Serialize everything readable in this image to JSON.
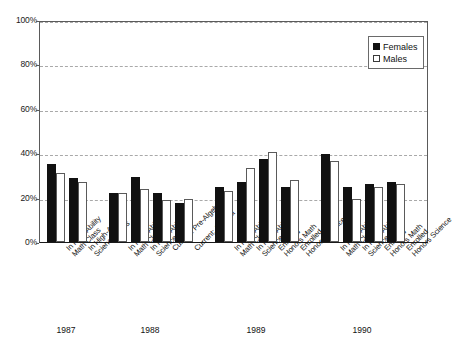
{
  "chart_data": {
    "type": "bar",
    "title": "",
    "xlabel": "",
    "ylabel": "",
    "ylim": [
      0,
      100
    ],
    "ytick_labels": [
      "100%",
      "80%",
      "60%",
      "40%",
      "20%",
      "0%"
    ],
    "yticks": [
      100,
      80,
      60,
      40,
      20,
      0
    ],
    "grid": "horizontal dashed gridlines at 20% intervals",
    "legend_position": "top-right inside plot",
    "value_unit": "percent",
    "legend": [
      {
        "name": "Females",
        "color": "#111111",
        "swatch": "filled-square"
      },
      {
        "name": "Males",
        "color": "#ffffff",
        "swatch": "open-square"
      }
    ],
    "series": [
      {
        "name": "Females",
        "values": [
          35,
          29,
          22,
          29.5,
          22,
          17.5,
          25,
          27,
          37.5,
          25,
          39.5,
          25,
          26,
          27
        ]
      },
      {
        "name": "Males",
        "values": [
          31,
          27,
          22,
          24,
          19,
          19.5,
          23,
          33.5,
          40.5,
          28,
          36.5,
          19.5,
          25,
          26
        ]
      }
    ],
    "categories": [
      "In High-Ability Math Class",
      "In High-Ability Science Class",
      "In High-Ability Math Class",
      "In High-Ability Science Class",
      "Current: Pre-Algebra",
      "Current: Algebra",
      "In High-Ability Math Class",
      "In High-Ability Science Class",
      "Enrolled Honors Math",
      "Enrolled Honors Science",
      "In High-Ability Math Class",
      "In High-Ability Science Class",
      "Enrolled Honors Math",
      "Enrolled Honors Science"
    ],
    "category_lines": [
      [
        "In High-Ability",
        "Math Class"
      ],
      [
        "In High-Ability",
        "Science Class"
      ],
      [
        "In High-Ability",
        "Math Class"
      ],
      [
        "In High-Ability",
        "Science Class"
      ],
      [
        "Current: Pre-Algebra",
        ""
      ],
      [
        "Current: Algebra",
        ""
      ],
      [
        "In High-Ability",
        "Math Class"
      ],
      [
        "In High-Ability",
        "Science Class"
      ],
      [
        "Enrolled",
        "Honors Math"
      ],
      [
        "Enrolled",
        "Honors Science"
      ],
      [
        "In High-Ability",
        "Math Class"
      ],
      [
        "In High-Ability",
        "Science Class"
      ],
      [
        "Enrolled",
        "Honors Math"
      ],
      [
        "Enrolled",
        "Honors Science"
      ]
    ],
    "groups": [
      {
        "label": "1987",
        "category_indices": [
          0,
          1
        ]
      },
      {
        "label": "1988",
        "category_indices": [
          2,
          3,
          4,
          5
        ]
      },
      {
        "label": "1989",
        "category_indices": [
          6,
          7,
          8,
          9
        ]
      },
      {
        "label": "1990",
        "category_indices": [
          10,
          11,
          12,
          13
        ]
      }
    ],
    "group_labels": [
      "1987",
      "1988",
      "1989",
      "1990"
    ]
  }
}
